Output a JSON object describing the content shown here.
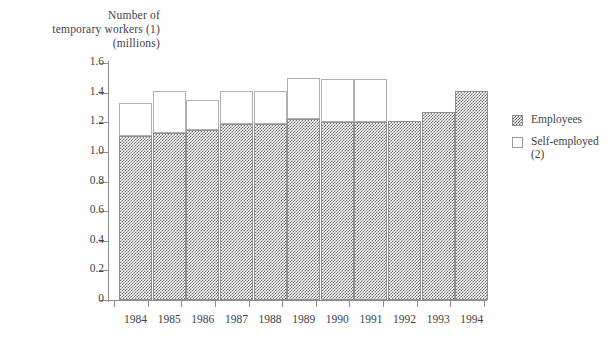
{
  "chart_data": {
    "type": "bar",
    "subtype": "stacked-vertical",
    "title": "Number of\ntemporary workers (1)\n(millions)",
    "xlabel": "",
    "ylabel": "Number of temporary workers (1) (millions)",
    "ylim": [
      0,
      1.6
    ],
    "ytick_values": [
      0,
      0.2,
      0.4,
      0.6,
      0.8,
      1.0,
      1.2,
      1.4,
      1.6
    ],
    "ytick_labels": [
      "0",
      "0.2",
      "0.4",
      "0.6",
      "0.8",
      "1.0",
      "1.2",
      "1.4",
      "1.6"
    ],
    "grid": false,
    "legend_position": "right",
    "categories": [
      "1984",
      "1985",
      "1986",
      "1987",
      "1988",
      "1989",
      "1990",
      "1991",
      "1992",
      "1993",
      "1994"
    ],
    "series": [
      {
        "name": "Employees",
        "pattern": "checkered",
        "color": "#6e6e6e",
        "values": [
          1.11,
          1.13,
          1.15,
          1.19,
          1.19,
          1.22,
          1.2,
          1.2,
          1.21,
          1.27,
          1.41
        ]
      },
      {
        "name": "Self-employed (2)",
        "pattern": "open",
        "color": "#ffffff",
        "values": [
          0.22,
          0.28,
          0.2,
          0.22,
          0.22,
          0.28,
          0.29,
          0.29,
          0.0,
          0.0,
          0.0
        ]
      }
    ],
    "totals": [
      1.33,
      1.41,
      1.35,
      1.41,
      1.41,
      1.5,
      1.49,
      1.49,
      1.21,
      1.27,
      1.41
    ]
  },
  "legend": {
    "items": [
      {
        "label": "Employees",
        "swatch": "checkered-swatch"
      },
      {
        "label": "Self-employed\n(2)",
        "swatch": "open-swatch"
      }
    ]
  }
}
